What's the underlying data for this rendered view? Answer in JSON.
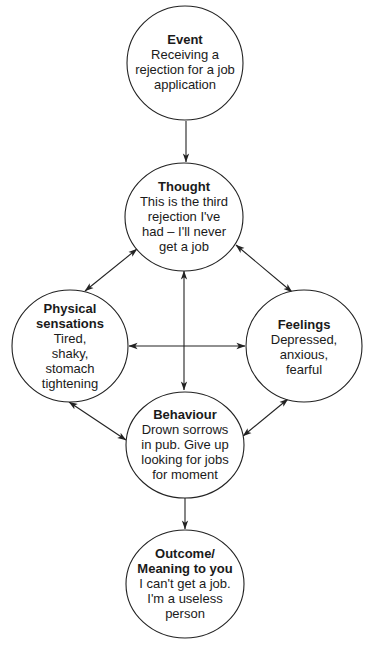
{
  "diagram": {
    "type": "cognitive-behavioural cycle",
    "nodes": [
      {
        "id": "event",
        "title_lines": [
          "Event"
        ],
        "body_lines": [
          "Receiving a",
          "rejection for a job",
          "application"
        ]
      },
      {
        "id": "thought",
        "title_lines": [
          "Thought"
        ],
        "body_lines": [
          "This is the third",
          "rejection I've",
          "had – I'll never",
          "get a job"
        ]
      },
      {
        "id": "physical",
        "title_lines": [
          "Physical",
          "sensations"
        ],
        "body_lines": [
          "Tired,",
          "shaky,",
          "stomach",
          "tightening"
        ]
      },
      {
        "id": "feelings",
        "title_lines": [
          "Feelings"
        ],
        "body_lines": [
          "Depressed,",
          "anxious,",
          "fearful"
        ]
      },
      {
        "id": "behaviour",
        "title_lines": [
          "Behaviour"
        ],
        "body_lines": [
          "Drown sorrows",
          "in pub. Give up",
          "looking for jobs",
          "for moment"
        ]
      },
      {
        "id": "outcome",
        "title_lines": [
          "Outcome/",
          "Meaning to you"
        ],
        "body_lines": [
          "I can't get a job.",
          "I'm a useless",
          "person"
        ]
      }
    ],
    "edges": [
      {
        "from": "event",
        "to": "thought",
        "direction": "one-way"
      },
      {
        "from": "thought",
        "to": "physical",
        "direction": "two-way"
      },
      {
        "from": "thought",
        "to": "feelings",
        "direction": "two-way"
      },
      {
        "from": "thought",
        "to": "behaviour",
        "direction": "two-way"
      },
      {
        "from": "physical",
        "to": "feelings",
        "direction": "two-way"
      },
      {
        "from": "physical",
        "to": "behaviour",
        "direction": "two-way"
      },
      {
        "from": "feelings",
        "to": "behaviour",
        "direction": "two-way"
      },
      {
        "from": "behaviour",
        "to": "outcome",
        "direction": "one-way"
      }
    ],
    "colors": {
      "stroke": "#222222",
      "fill": "#ffffff",
      "text": "#1a1a1a"
    }
  }
}
